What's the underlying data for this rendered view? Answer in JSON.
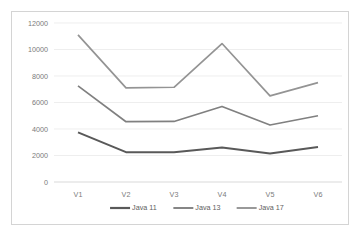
{
  "chart_data": {
    "type": "line",
    "title": "",
    "xlabel": "",
    "ylabel": "",
    "categories": [
      "V1",
      "V2",
      "V3",
      "V4",
      "V5",
      "V6"
    ],
    "ylim": [
      0,
      12000
    ],
    "yticks": [
      0,
      2000,
      4000,
      6000,
      8000,
      10000,
      12000
    ],
    "ytick_labels": [
      "0",
      "2000",
      "4000",
      "6000",
      "8000",
      "10000",
      "12000"
    ],
    "grid": true,
    "legend_position": "bottom",
    "series": [
      {
        "name": "Java 11",
        "color": "#595959",
        "values": [
          3750,
          2250,
          2250,
          2600,
          2150,
          2650
        ]
      },
      {
        "name": "Java 13",
        "color": "#808080",
        "values": [
          7250,
          4550,
          4570,
          5700,
          4300,
          5000
        ]
      },
      {
        "name": "Java 17",
        "color": "#949494",
        "values": [
          11100,
          7100,
          7150,
          10450,
          6500,
          7500
        ]
      }
    ]
  },
  "colors": {
    "frame_border": "#d4d4d4",
    "gridline": "#e6e6e6",
    "axis": "#cfcfcf",
    "tick_text": "#7b7b7b",
    "legend_text": "#5e5e5e",
    "background": "#ffffff"
  }
}
